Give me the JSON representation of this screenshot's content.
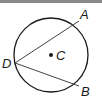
{
  "diagram": {
    "title": "",
    "circle": {
      "center_label": "C",
      "cx": 51,
      "cy": 55,
      "r": 37
    },
    "points": [
      {
        "label": "A",
        "x": 79,
        "y": 21,
        "lx": 80,
        "ly": 19
      },
      {
        "label": "B",
        "x": 79,
        "y": 86,
        "lx": 81,
        "ly": 96
      },
      {
        "label": "D",
        "x": 15,
        "y": 63,
        "lx": 2,
        "ly": 68
      }
    ],
    "segments": [
      {
        "from": "D",
        "to": "A"
      },
      {
        "from": "D",
        "to": "B"
      }
    ],
    "colors": {
      "stroke": "#1a1a1a",
      "chord": "#444444",
      "topbar": "#8a8a8a"
    }
  }
}
